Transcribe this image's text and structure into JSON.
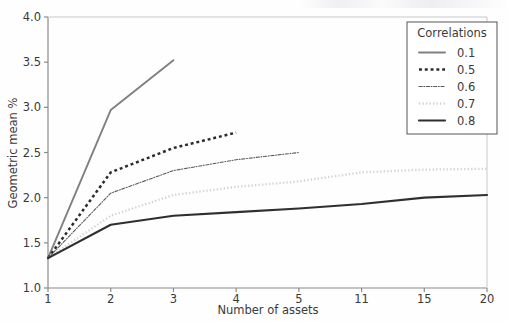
{
  "figure": {
    "background_color": "#fefefe",
    "axis_color": "#8a8a8a",
    "text_color": "#3a3a3a"
  },
  "chart_data": {
    "type": "line",
    "title": "",
    "xlabel": "Number of assets",
    "ylabel": "Geometric mean %",
    "x_categories": [
      "1",
      "2",
      "3",
      "4",
      "5",
      "11",
      "15",
      "20"
    ],
    "x_tick_labels": [
      "1",
      "2",
      "3",
      "4",
      "5",
      "11",
      "15",
      "20"
    ],
    "y_tick_labels": [
      "1.0",
      "1.5",
      "2.0",
      "2.5",
      "3.0",
      "3.5",
      "4.0"
    ],
    "y_ticks": [
      1.0,
      1.5,
      2.0,
      2.5,
      3.0,
      3.5,
      4.0
    ],
    "ylim": [
      1.0,
      4.0
    ],
    "xlim_categories": [
      0,
      7
    ],
    "grid": false,
    "legend": {
      "title": "Correlations",
      "position": "upper right",
      "border": true
    },
    "series": [
      {
        "name": "0.1",
        "label": "0.1",
        "color": "#808080",
        "linestyle": "solid",
        "linewidth": 1.9,
        "x": [
          "1",
          "2",
          "3"
        ],
        "values": [
          1.33,
          2.97,
          3.52
        ]
      },
      {
        "name": "0.5",
        "label": "0.5",
        "color": "#2b2b2b",
        "linestyle": "dashed",
        "linewidth": 2.5,
        "x": [
          "1",
          "2",
          "3",
          "4"
        ],
        "values": [
          1.33,
          2.28,
          2.55,
          2.72
        ]
      },
      {
        "name": "0.6",
        "label": "0.6",
        "color": "#5a5a5a",
        "linestyle": "dashdot",
        "linewidth": 1.1,
        "x": [
          "1",
          "2",
          "3",
          "4",
          "5"
        ],
        "values": [
          1.33,
          2.05,
          2.3,
          2.42,
          2.5
        ]
      },
      {
        "name": "0.7",
        "label": "0.7",
        "color": "#d2d2d2",
        "linestyle": "dotted",
        "linewidth": 2.3,
        "x": [
          "1",
          "2",
          "3",
          "4",
          "5",
          "11",
          "15",
          "20"
        ],
        "values": [
          1.33,
          1.8,
          2.03,
          2.12,
          2.18,
          2.28,
          2.31,
          2.32
        ]
      },
      {
        "name": "0.8",
        "label": "0.8",
        "color": "#2f2f2f",
        "linestyle": "solid",
        "linewidth": 2.1,
        "x": [
          "1",
          "2",
          "3",
          "4",
          "5",
          "11",
          "15",
          "20"
        ],
        "values": [
          1.33,
          1.7,
          1.8,
          1.84,
          1.88,
          1.93,
          2.0,
          2.03
        ]
      }
    ]
  }
}
